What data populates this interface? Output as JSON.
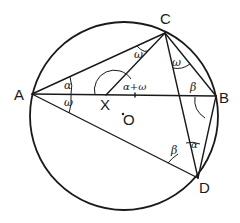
{
  "diagram": {
    "type": "cyclic-quadrilateral-geometry",
    "circle": {
      "center": [
        124,
        116
      ],
      "radius": 94,
      "center_label": "O"
    },
    "points": {
      "A": {
        "label": "A",
        "xy": [
          32,
          94
        ]
      },
      "B": {
        "label": "B",
        "xy": [
          216,
          96
        ]
      },
      "C": {
        "label": "C",
        "xy": [
          165,
          33
        ]
      },
      "D": {
        "label": "D",
        "xy": [
          198,
          178
        ]
      },
      "X": {
        "label": "X",
        "xy": [
          106,
          95
        ]
      },
      "O": {
        "label": "O",
        "xy": [
          124,
          116
        ]
      }
    },
    "segments": [
      "AC",
      "AB",
      "AD",
      "CX",
      "CB",
      "CD",
      "BD"
    ],
    "angle_labels": {
      "CAB": "α",
      "BAD": "ω",
      "ACX": "ω",
      "DCB": "ω",
      "CXB": "α+ω",
      "CBA": "β",
      "ADC": "β",
      "CDB": "α"
    }
  }
}
